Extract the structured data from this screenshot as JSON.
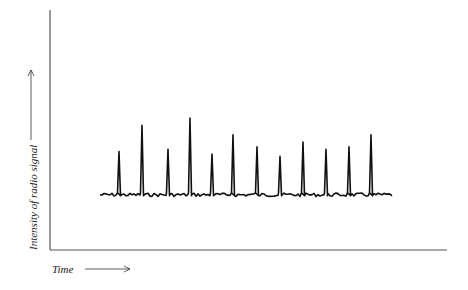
{
  "chart_data": {
    "type": "line",
    "title": "",
    "xlabel": "Time",
    "ylabel": "Intensity of radio signal",
    "grid": false,
    "axes_ticks": false,
    "baseline_level": 0.23,
    "pulses": [
      {
        "x": 119,
        "height": 0.41
      },
      {
        "x": 142,
        "height": 0.52
      },
      {
        "x": 168,
        "height": 0.42
      },
      {
        "x": 190,
        "height": 0.55
      },
      {
        "x": 212,
        "height": 0.4
      },
      {
        "x": 233,
        "height": 0.48
      },
      {
        "x": 257,
        "height": 0.43
      },
      {
        "x": 280,
        "height": 0.39
      },
      {
        "x": 303,
        "height": 0.45
      },
      {
        "x": 326,
        "height": 0.42
      },
      {
        "x": 349,
        "height": 0.43
      },
      {
        "x": 371,
        "height": 0.48
      }
    ],
    "trace_x_range": [
      100,
      392
    ]
  },
  "axes": {
    "y_label": "Intensity of radio signal",
    "x_label": "Time"
  },
  "colors": {
    "axis": "#555555",
    "trace": "#111111",
    "text": "#222222"
  }
}
